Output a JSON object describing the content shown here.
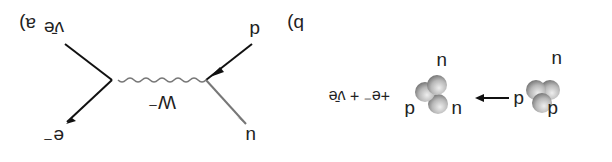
{
  "orientation": "rotated 180 degrees",
  "panel_a": {
    "label": "a)",
    "initial_quarks": [
      "u",
      "d",
      "d"
    ],
    "final_quarks": [
      "u",
      "u",
      "d"
    ],
    "products": "+e⁻ + ν̄e",
    "arrow": "right-arrow"
  },
  "panel_b": {
    "label": "b)",
    "incoming": "d",
    "outgoing_quark": "u",
    "boson": "W⁻",
    "lepton": "e⁻",
    "antineutrino": "ν̄e"
  }
}
